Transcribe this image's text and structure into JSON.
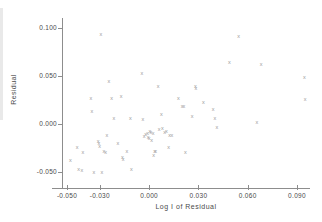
{
  "chart_data": {
    "type": "scatter",
    "title": "",
    "xlabel": "Log I of Residual",
    "ylabel": "Residual",
    "marker": "x",
    "marker_color": "#9a9a9a",
    "axis_color": "#8d8d8d",
    "background": "#ffffff",
    "grid": false,
    "legend": null,
    "xlim": [
      -0.056,
      0.1
    ],
    "ylim": [
      -0.063,
      0.106
    ],
    "xticks": [
      -0.05,
      -0.03,
      0.0,
      0.03,
      0.06,
      0.09
    ],
    "xtick_labels": [
      "-0.050",
      "-0.030",
      "0.000",
      "0.030",
      "0.060",
      "0.090"
    ],
    "yticks": [
      0.1,
      0.05,
      0.0,
      -0.05
    ],
    "ytick_labels": [
      "0.100",
      "0.050",
      "0.000",
      "-0.050"
    ],
    "n_points": 67,
    "points": [
      {
        "x": -0.0479,
        "y": -0.0375
      },
      {
        "x": -0.0438,
        "y": -0.0245
      },
      {
        "x": -0.043,
        "y": -0.047
      },
      {
        "x": -0.041,
        "y": -0.0483
      },
      {
        "x": -0.0404,
        "y": -0.0293
      },
      {
        "x": -0.0355,
        "y": 0.0269
      },
      {
        "x": -0.0349,
        "y": 0.0134
      },
      {
        "x": -0.0337,
        "y": -0.05
      },
      {
        "x": -0.031,
        "y": -0.0184
      },
      {
        "x": -0.0306,
        "y": -0.0207
      },
      {
        "x": -0.0301,
        "y": -0.0236
      },
      {
        "x": -0.0294,
        "y": 0.0931
      },
      {
        "x": -0.0288,
        "y": -0.0505
      },
      {
        "x": -0.0276,
        "y": -0.0285
      },
      {
        "x": -0.0265,
        "y": -0.0292
      },
      {
        "x": -0.0257,
        "y": -0.0119
      },
      {
        "x": -0.0245,
        "y": 0.0438
      },
      {
        "x": -0.0228,
        "y": 0.0265
      },
      {
        "x": -0.0215,
        "y": 0.0059
      },
      {
        "x": -0.019,
        "y": -0.02
      },
      {
        "x": -0.017,
        "y": 0.0285
      },
      {
        "x": -0.0163,
        "y": -0.0345
      },
      {
        "x": -0.0158,
        "y": -0.0367
      },
      {
        "x": -0.0135,
        "y": -0.0285
      },
      {
        "x": -0.0115,
        "y": 0.0053
      },
      {
        "x": -0.0108,
        "y": -0.0474
      },
      {
        "x": -0.0045,
        "y": 0.0531
      },
      {
        "x": -0.0038,
        "y": 0.005
      },
      {
        "x": -0.003,
        "y": -0.0125
      },
      {
        "x": -0.0022,
        "y": -0.0106
      },
      {
        "x": -0.001,
        "y": -0.0098
      },
      {
        "x": -0.0006,
        "y": -0.0136
      },
      {
        "x": 0.0,
        "y": -0.0155
      },
      {
        "x": 0.0005,
        "y": -0.0073
      },
      {
        "x": 0.0011,
        "y": -0.0092
      },
      {
        "x": 0.0024,
        "y": -0.0097
      },
      {
        "x": 0.0028,
        "y": -0.0331
      },
      {
        "x": 0.0033,
        "y": -0.0285
      },
      {
        "x": 0.004,
        "y": -0.029
      },
      {
        "x": 0.0055,
        "y": 0.0395
      },
      {
        "x": 0.006,
        "y": -0.0062
      },
      {
        "x": 0.0075,
        "y": 0.0103
      },
      {
        "x": 0.008,
        "y": -0.0049
      },
      {
        "x": 0.0094,
        "y": -0.0088
      },
      {
        "x": 0.0105,
        "y": -0.008
      },
      {
        "x": 0.0118,
        "y": -0.024
      },
      {
        "x": 0.0124,
        "y": -0.0115
      },
      {
        "x": 0.0138,
        "y": -0.012
      },
      {
        "x": 0.0178,
        "y": 0.0261
      },
      {
        "x": 0.02,
        "y": 0.018
      },
      {
        "x": 0.022,
        "y": -0.03
      },
      {
        "x": 0.0262,
        "y": 0.0078
      },
      {
        "x": 0.0281,
        "y": 0.0392
      },
      {
        "x": 0.0285,
        "y": 0.037
      },
      {
        "x": 0.033,
        "y": 0.0229
      },
      {
        "x": 0.0389,
        "y": 0.0148
      },
      {
        "x": 0.04,
        "y": 0.0056
      },
      {
        "x": 0.0412,
        "y": -0.004
      },
      {
        "x": 0.0488,
        "y": 0.0641
      },
      {
        "x": 0.0545,
        "y": 0.0909
      },
      {
        "x": 0.0655,
        "y": 0.002
      },
      {
        "x": 0.0682,
        "y": 0.062
      },
      {
        "x": 0.0945,
        "y": 0.0483
      },
      {
        "x": 0.095,
        "y": 0.0254
      },
      {
        "x": 0.0212,
        "y": 0.0186
      },
      {
        "x": 0.0015,
        "y": -0.017
      }
    ]
  }
}
